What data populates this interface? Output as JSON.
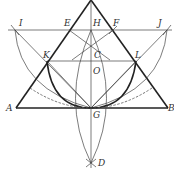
{
  "diagram": {
    "labels": {
      "I": "I",
      "E": "E",
      "H": "H",
      "F": "F",
      "J": "J",
      "K": "K",
      "C": "C",
      "L": "L",
      "O": "O",
      "A": "A",
      "B": "B",
      "G": "G",
      "D": "D"
    },
    "points": {
      "apex": [
        91,
        0
      ],
      "I": [
        15,
        30
      ],
      "E": [
        69,
        30
      ],
      "H": [
        91,
        30
      ],
      "F": [
        113,
        30
      ],
      "J": [
        167,
        30
      ],
      "K": [
        47,
        61
      ],
      "C": [
        91,
        61
      ],
      "L": [
        136,
        61
      ],
      "O": [
        91,
        71
      ],
      "A": [
        16,
        108
      ],
      "G": [
        91,
        108
      ],
      "B": [
        168,
        108
      ],
      "D": [
        91,
        163
      ]
    },
    "colors": {
      "line": "#222222",
      "thin": "#444444",
      "background": "#ffffff"
    }
  }
}
